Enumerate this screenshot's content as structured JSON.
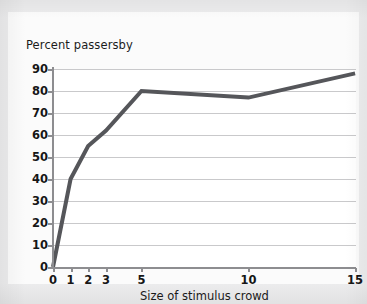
{
  "chart_data": {
    "type": "line",
    "title": "Percent passersby",
    "xlabel": "Size of stimulus crowd",
    "ylabel": "Percent passersby",
    "grid": true,
    "legend": "none",
    "ylim": [
      0,
      90
    ],
    "yticks": [
      0,
      10,
      20,
      30,
      40,
      50,
      60,
      70,
      80,
      90
    ],
    "ytick_labels": [
      "0",
      "10",
      "20",
      "30",
      "40",
      "50",
      "60",
      "70",
      "80",
      "90"
    ],
    "xticks": [
      0,
      1,
      2,
      3,
      5,
      10,
      15
    ],
    "xtick_labels": [
      "0",
      "1",
      "2",
      "3",
      "5",
      "10",
      "15"
    ],
    "x_axis_scale": "categorical",
    "series": [
      {
        "name": "Percent passersby",
        "color": "#55565a",
        "line_width": 4,
        "x": [
          0,
          1,
          2,
          3,
          5,
          10,
          15
        ],
        "values": [
          0,
          40,
          55,
          62,
          80,
          77,
          88
        ]
      }
    ],
    "x": [
      0,
      1,
      2,
      3,
      5,
      10,
      15
    ],
    "categories": [
      "0",
      "1",
      "2",
      "3",
      "5",
      "10",
      "15"
    ],
    "values": [
      0,
      40,
      55,
      62,
      80,
      77,
      88
    ]
  },
  "colors": {
    "page_background": "#ececed",
    "figure_background": "#fbfbfb",
    "plot_background": "#ffffff",
    "gridline": "#c9c9cb",
    "axis": "#8d8d90",
    "text": "#161616",
    "line": "#55565a"
  }
}
